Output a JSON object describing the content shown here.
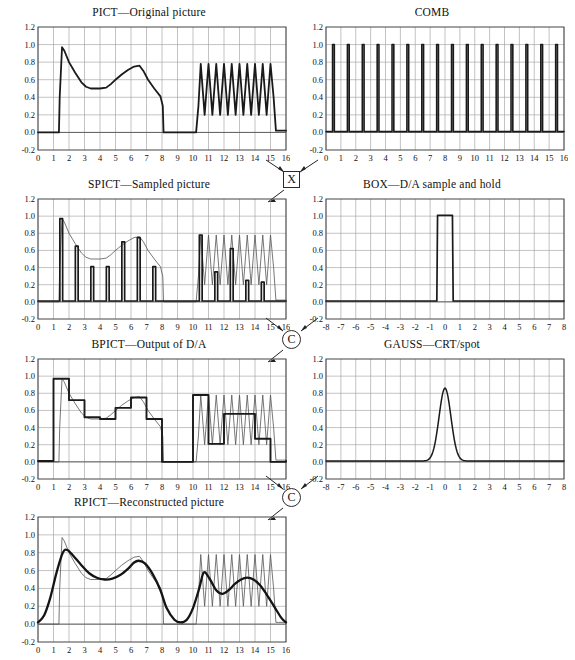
{
  "figure": {
    "axis": {
      "y_ticks": [
        "1.2",
        "1.0",
        "0.8",
        "0.6",
        "0.4",
        "0.2",
        "0.0",
        "-0.2"
      ],
      "y_values": [
        1.2,
        1.0,
        0.8,
        0.6,
        0.4,
        0.2,
        0.0,
        -0.2
      ],
      "x_ticks_16": [
        "0",
        "1",
        "2",
        "3",
        "4",
        "5",
        "6",
        "7",
        "8",
        "9",
        "10",
        "11",
        "12",
        "13",
        "14",
        "15",
        "16"
      ],
      "x_ticks_8": [
        "-8",
        "-7",
        "-6",
        "-5",
        "-4",
        "-3",
        "-2",
        "-1",
        "0",
        "1",
        "2",
        "3",
        "4",
        "5",
        "6",
        "7",
        "8"
      ],
      "ylim": [
        -0.2,
        1.2
      ],
      "xlim_16": [
        0,
        16
      ],
      "xlim_8": [
        -8,
        8
      ],
      "grid": true
    },
    "operators": [
      {
        "name": "multiply",
        "symbol": "×",
        "shape": "square",
        "label": "X"
      },
      {
        "name": "convolve-1",
        "symbol": "C",
        "shape": "circle",
        "label": "C"
      },
      {
        "name": "convolve-2",
        "symbol": "C",
        "shape": "circle",
        "label": "C"
      }
    ]
  },
  "panels": {
    "pict": {
      "title": "PICT—Original picture",
      "xaxis": "16"
    },
    "comb": {
      "title": "COMB",
      "xaxis": "16"
    },
    "spict": {
      "title": "SPICT—Sampled picture",
      "xaxis": "16"
    },
    "box": {
      "title": "BOX—D/A sample and hold",
      "xaxis": "8"
    },
    "bpict": {
      "title": "BPICT—Output of D/A",
      "xaxis": "16"
    },
    "gauss": {
      "title": "GAUSS—CRT/spot",
      "xaxis": "8"
    },
    "rpict": {
      "title": "RPICT—Reconstructed picture",
      "xaxis": "16"
    }
  },
  "chart_data": [
    {
      "id": "pict",
      "type": "line",
      "title": "PICT—Original picture",
      "xlabel": "",
      "ylabel": "",
      "xlim": [
        0,
        16
      ],
      "ylim": [
        -0.2,
        1.2
      ],
      "grid": true,
      "series": [
        {
          "name": "original",
          "x": [
            0,
            1.35,
            1.4,
            1.55,
            1.7,
            2.0,
            2.4,
            2.8,
            3.1,
            3.4,
            4.0,
            4.4,
            4.7,
            5.0,
            5.4,
            5.8,
            6.2,
            6.55,
            6.8,
            7.1,
            7.5,
            7.9,
            8.05,
            8.1,
            10.2,
            10.35,
            10.5,
            10.75,
            11.0,
            11.25,
            11.5,
            11.75,
            12.0,
            12.25,
            12.5,
            12.75,
            13.0,
            13.25,
            13.5,
            13.75,
            14.0,
            14.25,
            14.5,
            14.75,
            15.0,
            15.2,
            15.35,
            15.5,
            16.0
          ],
          "y": [
            0.0,
            0.0,
            0.4,
            0.97,
            0.93,
            0.8,
            0.68,
            0.57,
            0.52,
            0.5,
            0.5,
            0.51,
            0.55,
            0.6,
            0.66,
            0.71,
            0.75,
            0.76,
            0.7,
            0.6,
            0.5,
            0.41,
            0.3,
            0.0,
            0.0,
            0.3,
            0.78,
            0.2,
            0.78,
            0.2,
            0.78,
            0.2,
            0.78,
            0.2,
            0.78,
            0.2,
            0.78,
            0.2,
            0.78,
            0.2,
            0.78,
            0.2,
            0.78,
            0.2,
            0.78,
            0.4,
            0.02,
            0.02,
            0.02
          ]
        }
      ]
    },
    {
      "id": "comb",
      "type": "line",
      "title": "COMB",
      "xlim": [
        0,
        16
      ],
      "ylim": [
        -0.2,
        1.2
      ],
      "grid": true,
      "impulse_positions": [
        0.5,
        1.5,
        2.5,
        3.5,
        4.5,
        5.5,
        6.5,
        7.5,
        8.5,
        9.5,
        10.5,
        11.5,
        12.5,
        13.5,
        14.5,
        15.5
      ],
      "impulse_height": 1.0,
      "impulse_width": 0.12
    },
    {
      "id": "spict",
      "type": "line",
      "title": "SPICT—Sampled picture",
      "xlim": [
        0,
        16
      ],
      "ylim": [
        -0.2,
        1.2
      ],
      "grid": true,
      "sample_positions": [
        1.5,
        2.5,
        3.5,
        4.5,
        5.5,
        6.5,
        7.5,
        10.5,
        11.5,
        12.5,
        13.5,
        14.5
      ],
      "sample_values": [
        0.97,
        0.65,
        0.41,
        0.41,
        0.7,
        0.75,
        0.41,
        0.78,
        0.35,
        0.62,
        0.25,
        0.23
      ],
      "envelope_ref": "pict"
    },
    {
      "id": "box",
      "type": "line",
      "title": "BOX—D/A sample and hold",
      "xlim": [
        -8,
        8
      ],
      "ylim": [
        -0.2,
        1.2
      ],
      "grid": true,
      "series": [
        {
          "name": "box",
          "x": [
            -8,
            -0.55,
            -0.5,
            0.5,
            0.55,
            8
          ],
          "y": [
            0.01,
            0.01,
            1.01,
            1.01,
            0.01,
            0.01
          ]
        }
      ]
    },
    {
      "id": "bpict",
      "type": "line",
      "title": "BPICT—Output of D/A",
      "xlim": [
        0,
        16
      ],
      "ylim": [
        -0.2,
        1.2
      ],
      "grid": true,
      "step_edges": [
        1.0,
        2.0,
        3.0,
        4.0,
        5.0,
        6.0,
        7.0,
        8.0,
        10.0,
        11.0,
        12.0,
        13.0,
        14.0,
        15.0
      ],
      "step_values": [
        0.97,
        0.72,
        0.52,
        0.5,
        0.63,
        0.75,
        0.5,
        0.0,
        0.78,
        0.21,
        0.56,
        0.56,
        0.27,
        0.0
      ],
      "overlay_ref": "pict"
    },
    {
      "id": "gauss",
      "type": "line",
      "title": "GAUSS—CRT/spot",
      "xlim": [
        -8,
        8
      ],
      "ylim": [
        -0.2,
        1.2
      ],
      "grid": true,
      "peak_x": 0.0,
      "peak_y": 0.85,
      "sigma": 0.4
    },
    {
      "id": "rpict",
      "type": "line",
      "title": "RPICT—Reconstructed picture",
      "xlim": [
        0,
        16
      ],
      "ylim": [
        -0.2,
        1.2
      ],
      "grid": true,
      "series": [
        {
          "name": "reconstructed",
          "x": [
            0,
            0.4,
            0.8,
            1.2,
            1.6,
            1.9,
            2.3,
            2.8,
            3.3,
            3.8,
            4.3,
            4.8,
            5.3,
            5.8,
            6.2,
            6.5,
            6.9,
            7.4,
            7.9,
            8.3,
            8.8,
            9.2,
            9.6,
            10.0,
            10.4,
            10.7,
            11.1,
            11.5,
            11.9,
            12.3,
            12.7,
            13.1,
            13.5,
            13.9,
            14.3,
            14.8,
            15.3,
            15.7,
            16.0
          ],
          "y": [
            0.02,
            0.1,
            0.3,
            0.58,
            0.8,
            0.83,
            0.76,
            0.66,
            0.57,
            0.52,
            0.5,
            0.51,
            0.55,
            0.62,
            0.69,
            0.71,
            0.68,
            0.56,
            0.38,
            0.18,
            0.05,
            0.02,
            0.05,
            0.18,
            0.4,
            0.58,
            0.5,
            0.38,
            0.34,
            0.38,
            0.45,
            0.5,
            0.52,
            0.5,
            0.44,
            0.32,
            0.18,
            0.07,
            0.02
          ]
        }
      ],
      "overlay_ref": "pict"
    }
  ]
}
